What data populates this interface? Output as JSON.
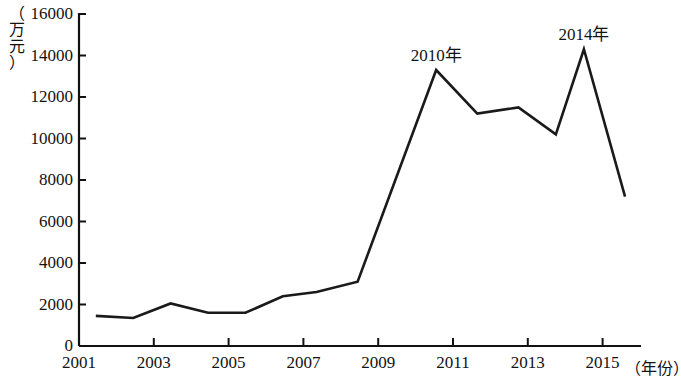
{
  "chart_data": {
    "type": "line",
    "title": "",
    "subtitle": "",
    "xlabel": "（年份）",
    "ylabel": "（万元）",
    "xlim": [
      2001,
      2016
    ],
    "ylim": [
      0,
      16000
    ],
    "grid": false,
    "legend": null,
    "y_ticks": [
      0,
      2000,
      4000,
      6000,
      8000,
      10000,
      12000,
      14000,
      16000
    ],
    "y_tick_labels": [
      "0",
      "2000",
      "4000",
      "6000",
      "8000",
      "10000",
      "12000",
      "14000",
      "16000"
    ],
    "x_ticks": [
      2001,
      2003,
      2005,
      2007,
      2009,
      2011,
      2013,
      2015
    ],
    "x_tick_labels": [
      "2001",
      "2003",
      "2005",
      "2007",
      "2009",
      "2011",
      "2013",
      "2015"
    ],
    "series": [
      {
        "name": "金额",
        "color": "#1a1a1a",
        "x": [
          2001.45,
          2002.45,
          2003.45,
          2004.45,
          2005.45,
          2006.45,
          2007.35,
          2008.45,
          2010.55,
          2011.65,
          2012.75,
          2013.75,
          2014.5,
          2015.6
        ],
        "values": [
          1450,
          1350,
          2050,
          1600,
          1600,
          2400,
          2600,
          3100,
          13300,
          11200,
          11500,
          10200,
          14300,
          7200
        ]
      }
    ],
    "annotations": [
      {
        "label": "2010年",
        "x": 2010.55,
        "y": 13300,
        "position": "above-peak"
      },
      {
        "label": "2014年",
        "x": 2014.5,
        "y": 14300,
        "position": "above-peak"
      }
    ]
  },
  "axes": {
    "y_title_chars": [
      "（",
      "万",
      "元",
      "）"
    ],
    "x_title": "（年份）"
  }
}
